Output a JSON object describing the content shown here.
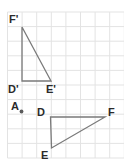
{
  "figure": {
    "grid": {
      "line_color": "#e3e3e3",
      "cell_size": 14.6,
      "origin_x": 7.5,
      "origin_y": 12.0,
      "columns": 8,
      "rows": 10,
      "visible": true
    },
    "style": {
      "shape_stroke_color": "#7a7a7a",
      "shape_stroke_width": 1.3,
      "label_color": "#2a2a2a",
      "point_color": "#5a5a5a",
      "background_color": "#ffffff"
    },
    "center_of_dilation": {
      "label": "A",
      "label_x": 11,
      "label_y": 107,
      "dot_x": 21.5,
      "dot_y": 111.5,
      "dot_radius": 1.9
    },
    "shapes": [
      {
        "name": "triangle-d-prime-e-prime-f-prime",
        "closed": true,
        "vertices": [
          {
            "label": "F'",
            "x": 22.0,
            "y": 27.0,
            "label_x": 9.0,
            "label_y": 20.0
          },
          {
            "label": "E'",
            "x": 51.0,
            "y": 81.0,
            "label_x": 46.0,
            "label_y": 90.0
          },
          {
            "label": "D'",
            "x": 22.0,
            "y": 81.0,
            "label_x": 8.0,
            "label_y": 90.0
          }
        ]
      },
      {
        "name": "triangle-d-e-f",
        "closed": true,
        "vertices": [
          {
            "label": "D",
            "x": 50.5,
            "y": 117.0,
            "label_x": 37.0,
            "label_y": 113.0
          },
          {
            "label": "F",
            "x": 105.0,
            "y": 117.0,
            "label_x": 108.0,
            "label_y": 113.0
          },
          {
            "label": "E",
            "x": 51.5,
            "y": 148.0,
            "label_x": 41.0,
            "label_y": 156.0
          }
        ]
      }
    ]
  }
}
